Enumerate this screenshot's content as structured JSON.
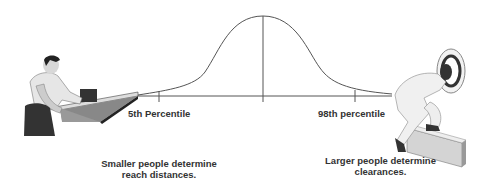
{
  "curve": {
    "type": "normal-distribution",
    "line_color": "#555555",
    "markers": [
      {
        "name": "5th-percentile",
        "label": "5th Percentile"
      },
      {
        "name": "mean",
        "label": ""
      },
      {
        "name": "98th-percentile",
        "label": "98th percentile"
      }
    ]
  },
  "left_caption": {
    "line1": "Smaller people determine",
    "line2": "reach distances."
  },
  "right_caption": {
    "line1": "Larger people determine",
    "line2": "clearances."
  },
  "figures": {
    "left": "small person reaching across table",
    "right": "large person ducking through hatch over beam"
  }
}
